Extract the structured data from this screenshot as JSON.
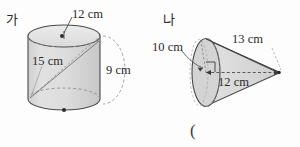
{
  "page": {
    "background_color": "#fdfdfd",
    "ink_color": "#2b2b2b",
    "solid_fill_color": "#d8d8d8",
    "solid_stroke_color": "#4a4a4a",
    "hidden_edge_color": "#9a9a9a"
  },
  "figures": [
    {
      "id": "cylinder",
      "name_label": "가",
      "shape": "cylinder",
      "dimensions": [
        {
          "key": "diameter",
          "text": "12 cm",
          "value": 12,
          "unit": "cm"
        },
        {
          "key": "diagonal",
          "text": "15 cm",
          "value": 15,
          "unit": "cm"
        },
        {
          "key": "height",
          "text": "9 cm",
          "value": 9,
          "unit": "cm"
        }
      ]
    },
    {
      "id": "cone",
      "name_label": "나",
      "shape": "cone",
      "dimensions": [
        {
          "key": "radius",
          "text": "10 cm",
          "value": 10,
          "unit": "cm"
        },
        {
          "key": "slant",
          "text": "13 cm",
          "value": 13,
          "unit": "cm"
        },
        {
          "key": "height",
          "text": "12 cm",
          "value": 12,
          "unit": "cm"
        }
      ]
    }
  ],
  "answer_field": {
    "open_paren": "("
  }
}
